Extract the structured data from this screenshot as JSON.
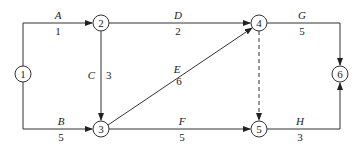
{
  "diagram": {
    "type": "activity-on-arrow network",
    "nodes": [
      {
        "id": "1",
        "x": 23,
        "y": 74
      },
      {
        "id": "2",
        "x": 101,
        "y": 23
      },
      {
        "id": "3",
        "x": 101,
        "y": 129
      },
      {
        "id": "4",
        "x": 259,
        "y": 23
      },
      {
        "id": "5",
        "x": 259,
        "y": 129
      },
      {
        "id": "6",
        "x": 340,
        "y": 74
      }
    ],
    "activities": [
      {
        "name": "A",
        "duration": "1",
        "from": "1",
        "to": "2"
      },
      {
        "name": "B",
        "duration": "5",
        "from": "1",
        "to": "3"
      },
      {
        "name": "C",
        "duration": "3",
        "from": "2",
        "to": "3"
      },
      {
        "name": "D",
        "duration": "2",
        "from": "2",
        "to": "4"
      },
      {
        "name": "E",
        "duration": "6",
        "from": "3",
        "to": "4"
      },
      {
        "name": "F",
        "duration": "5",
        "from": "3",
        "to": "5"
      },
      {
        "name": "G",
        "duration": "5",
        "from": "4",
        "to": "6"
      },
      {
        "name": "H",
        "duration": "3",
        "from": "5",
        "to": "6"
      }
    ],
    "dummy": {
      "from": "4",
      "to": "5",
      "style": "dashed"
    }
  }
}
